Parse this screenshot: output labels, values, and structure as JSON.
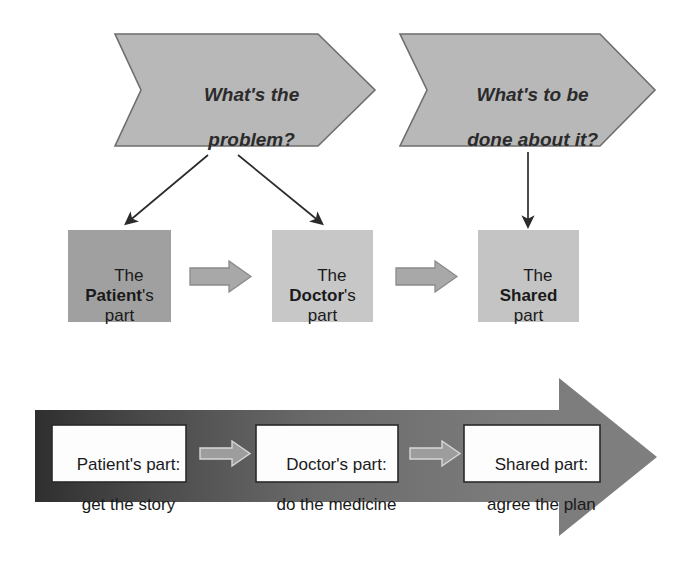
{
  "diagram": {
    "questions": [
      {
        "id": "q1",
        "text_line1": "What's the",
        "text_line2": "problem?"
      },
      {
        "id": "q2",
        "text_line1": "What's to be",
        "text_line2": "done about it?"
      }
    ],
    "parts": [
      {
        "id": "patient",
        "prefix": "The",
        "emphasis": "Patient",
        "suffix": "'s",
        "tail": "part",
        "fill": "#a0a0a0"
      },
      {
        "id": "doctor",
        "prefix": "The",
        "emphasis": "Doctor",
        "suffix": "'s",
        "tail": "part",
        "fill": "#c7c7c7"
      },
      {
        "id": "shared",
        "prefix": "The",
        "emphasis": "Shared",
        "suffix": "",
        "tail": "part",
        "fill": "#c4c4c4"
      }
    ],
    "process": [
      {
        "id": "patient-step",
        "line1": "Patient's part:",
        "line2": "get the story"
      },
      {
        "id": "doctor-step",
        "line1": "Doctor's part:",
        "line2": "do the medicine"
      },
      {
        "id": "shared-step",
        "line1": "Shared part:",
        "line2": "agree the plan"
      }
    ],
    "colors": {
      "chevron_fill": "#b8b8b8",
      "chevron_stroke": "#6e6e6e",
      "connector_arrow_fill": "#a8a8a8",
      "connector_arrow_stroke": "#8a8a8a",
      "big_arrow_gradient_start": "#3b3b3b",
      "big_arrow_gradient_end": "#7f7f7f",
      "big_arrow_head": "#7a7a7a",
      "white_box_fill": "#fdfdfd",
      "white_box_stroke": "#2a2a2a",
      "line_color": "#2b2b2b"
    }
  }
}
